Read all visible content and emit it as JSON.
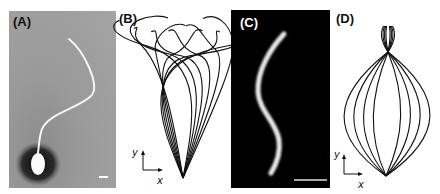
{
  "figure": {
    "panels": [
      {
        "id": "A",
        "label": "(A)",
        "description": "Micrograph of sperm cell with curved flagellum on gray background",
        "scale_bar": true
      },
      {
        "id": "B",
        "label": "(B)",
        "description": "Overlaid flagellar waveform traces forming funnel shape",
        "axes": {
          "x": "x",
          "y": "y"
        }
      },
      {
        "id": "C",
        "label": "(C)",
        "description": "Fluorescence image of S-shaped flagellum on black background",
        "scale_bar": true
      },
      {
        "id": "D",
        "label": "(D)",
        "description": "Overlaid symmetric flagellar waveform traces forming lens shape",
        "axes": {
          "x": "x",
          "y": "y"
        }
      }
    ]
  }
}
